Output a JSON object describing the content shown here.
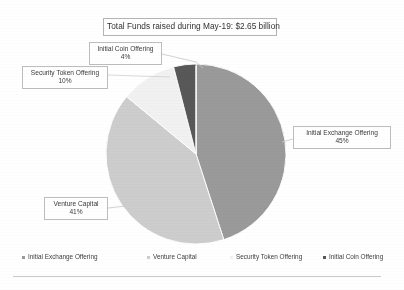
{
  "chart_data": {
    "type": "pie",
    "title": "Total Funds raised during May-19: $2.65 billion",
    "categories": [
      "Initial Exchange Offering",
      "Venture Capital",
      "Security Token Offering",
      "Initial Coin Offering"
    ],
    "values": [
      45,
      41,
      10,
      4
    ],
    "value_unit": "%",
    "total_label": "$2.65 billion",
    "period": "May-19",
    "legend_position": "bottom",
    "grid": false,
    "colors": [
      "#9a9a9a",
      "#cdcdcd",
      "#f1f1f1",
      "#585858"
    ],
    "slices": [
      {
        "label": "Initial Exchange Offering",
        "value": 45,
        "display": "45%",
        "color": "#9a9a9a"
      },
      {
        "label": "Venture Capital",
        "value": 41,
        "display": "41%",
        "color": "#cdcdcd"
      },
      {
        "label": "Security Token Offering",
        "value": 10,
        "display": "10%",
        "color": "#f1f1f1"
      },
      {
        "label": "Initial Coin Offering",
        "value": 4,
        "display": "4%",
        "color": "#585858"
      }
    ]
  },
  "title": {
    "text": "Total Funds raised during May-19: $2.65 billion"
  },
  "callouts": {
    "ico": {
      "label": "Initial Coin Offering",
      "percent": "4%"
    },
    "sto": {
      "label": "Security Token Offering",
      "percent": "10%"
    },
    "ieo": {
      "label": "Initial Exchange Offering",
      "percent": "45%"
    },
    "vc": {
      "label": "Venture Capital",
      "percent": "41%"
    }
  },
  "legend": {
    "items": [
      {
        "label": "Initial Exchange Offering",
        "color": "#9a9a9a"
      },
      {
        "label": "Venture Capital",
        "color": "#cdcdcd"
      },
      {
        "label": "Security Token Offering",
        "color": "#f1f1f1"
      },
      {
        "label": "Initial Coin Offering",
        "color": "#585858"
      }
    ]
  }
}
